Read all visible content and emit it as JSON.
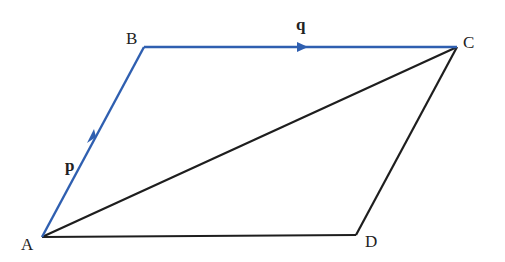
{
  "diagram": {
    "points": [
      {
        "id": "A",
        "label": "A"
      },
      {
        "id": "B",
        "label": "B"
      },
      {
        "id": "C",
        "label": "C"
      },
      {
        "id": "D",
        "label": "D"
      }
    ],
    "vectors": [
      {
        "id": "p",
        "label": "p",
        "from": "A",
        "to": "B"
      },
      {
        "id": "q",
        "label": "q",
        "from": "B",
        "to": "C"
      }
    ],
    "segments": [
      {
        "from": "A",
        "to": "C"
      },
      {
        "from": "C",
        "to": "D"
      },
      {
        "from": "D",
        "to": "A"
      }
    ],
    "colors": {
      "vector": "#2f5fb0",
      "segment": "#1e1e1e"
    }
  }
}
